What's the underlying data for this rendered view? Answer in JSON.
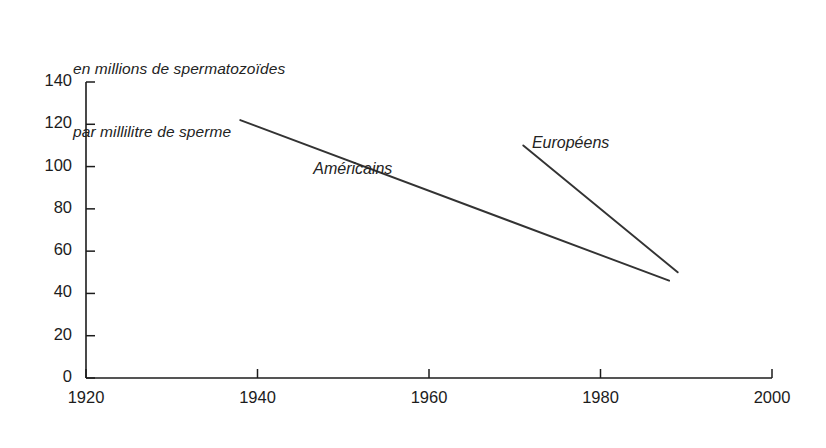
{
  "chart_data": {
    "type": "line",
    "title": "",
    "ylabel_lines": [
      "en millions de spermatozoïdes",
      "par millilitre de sperme"
    ],
    "xlabel": "",
    "xlim": [
      1920,
      2000
    ],
    "ylim": [
      0,
      140
    ],
    "xticks": [
      1920,
      1940,
      1960,
      1980,
      2000
    ],
    "xtick_labels": [
      "1920",
      "1940",
      "1960",
      "1980",
      "2000"
    ],
    "yticks": [
      0,
      20,
      40,
      60,
      80,
      100,
      120,
      140
    ],
    "ytick_labels": [
      "0",
      "20",
      "40",
      "60",
      "80",
      "100",
      "120",
      "140"
    ],
    "grid": false,
    "legend": "in-plot annotations",
    "line_color": "#333333",
    "axis_color": "#1c1c1c",
    "series": [
      {
        "name": "Américains",
        "label": "Américains",
        "label_x": 1946.5,
        "label_y": 98,
        "x": [
          1938,
          1988
        ],
        "values": [
          122,
          46
        ]
      },
      {
        "name": "Européens",
        "label": "Européens",
        "label_x": 1972,
        "label_y": 110,
        "x": [
          1971,
          1989
        ],
        "values": [
          110,
          50
        ]
      }
    ]
  }
}
